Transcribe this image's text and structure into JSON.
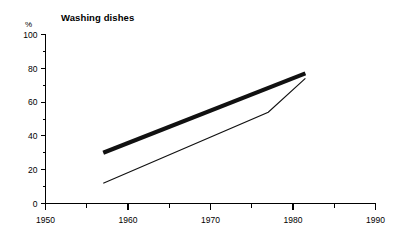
{
  "chart_data": {
    "type": "line",
    "title": "Washing dishes",
    "xlabel": "",
    "ylabel": "%",
    "y_unit_label": "%",
    "xlim": [
      1950,
      1990
    ],
    "ylim": [
      0,
      100
    ],
    "grid": false,
    "legend": "none",
    "x_ticks": [
      1950,
      1960,
      1970,
      1980,
      1990
    ],
    "x_tick_labels": [
      "1950",
      "1960",
      "1970",
      "1980",
      "1990"
    ],
    "x_minor_ticks": [
      1955,
      1965,
      1975,
      1985
    ],
    "y_ticks": [
      0,
      20,
      40,
      60,
      80,
      100
    ],
    "y_tick_labels": [
      "0",
      "20",
      "40",
      "60",
      "80",
      "100"
    ],
    "y_minor_ticks": [
      10,
      30,
      50,
      70,
      90
    ],
    "series": [
      {
        "name": "thick-line",
        "style": "thick",
        "x": [
          1957,
          1981.5
        ],
        "values": [
          30,
          77
        ]
      },
      {
        "name": "thin-line",
        "style": "thin",
        "x": [
          1957,
          1977,
          1981.5
        ],
        "values": [
          12,
          54,
          74
        ]
      }
    ]
  }
}
